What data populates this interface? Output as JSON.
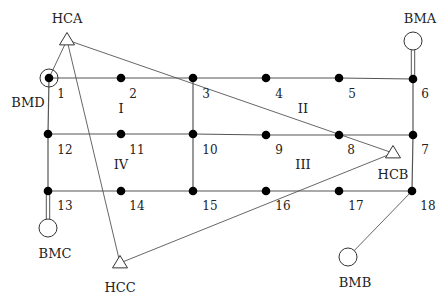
{
  "diagram": {
    "type": "grid-network",
    "colors": {
      "line": "#555555",
      "node": "#000000",
      "background": "#ffffff"
    },
    "nodes": [
      {
        "id": "1",
        "x": 49,
        "y": 78
      },
      {
        "id": "2",
        "x": 121,
        "y": 78
      },
      {
        "id": "3",
        "x": 193,
        "y": 78
      },
      {
        "id": "4",
        "x": 266,
        "y": 78
      },
      {
        "id": "5",
        "x": 339,
        "y": 78
      },
      {
        "id": "6",
        "x": 413,
        "y": 79
      },
      {
        "id": "7",
        "x": 413,
        "y": 135
      },
      {
        "id": "8",
        "x": 339,
        "y": 135
      },
      {
        "id": "9",
        "x": 266,
        "y": 135
      },
      {
        "id": "10",
        "x": 193,
        "y": 134
      },
      {
        "id": "11",
        "x": 121,
        "y": 134
      },
      {
        "id": "12",
        "x": 48,
        "y": 134
      },
      {
        "id": "13",
        "x": 48,
        "y": 191
      },
      {
        "id": "14",
        "x": 121,
        "y": 191
      },
      {
        "id": "15",
        "x": 193,
        "y": 191
      },
      {
        "id": "16",
        "x": 266,
        "y": 191
      },
      {
        "id": "17",
        "x": 339,
        "y": 191
      },
      {
        "id": "18",
        "x": 412,
        "y": 191
      }
    ],
    "node_labels": [
      {
        "text": "1",
        "x": 61,
        "y": 94
      },
      {
        "text": "2",
        "x": 133,
        "y": 94
      },
      {
        "text": "3",
        "x": 206,
        "y": 94
      },
      {
        "text": "4",
        "x": 279,
        "y": 94
      },
      {
        "text": "5",
        "x": 352,
        "y": 94
      },
      {
        "text": "6",
        "x": 425,
        "y": 94
      },
      {
        "text": "7",
        "x": 425,
        "y": 150
      },
      {
        "text": "8",
        "x": 351,
        "y": 150
      },
      {
        "text": "9",
        "x": 279,
        "y": 150
      },
      {
        "text": "10",
        "x": 210,
        "y": 150
      },
      {
        "text": "11",
        "x": 137,
        "y": 150
      },
      {
        "text": "12",
        "x": 65,
        "y": 150
      },
      {
        "text": "13",
        "x": 65,
        "y": 206
      },
      {
        "text": "14",
        "x": 137,
        "y": 206
      },
      {
        "text": "15",
        "x": 210,
        "y": 206
      },
      {
        "text": "16",
        "x": 283,
        "y": 206
      },
      {
        "text": "17",
        "x": 356,
        "y": 206
      },
      {
        "text": "18",
        "x": 428,
        "y": 206
      }
    ],
    "region_labels": [
      {
        "text": "I",
        "x": 121,
        "y": 108
      },
      {
        "text": "II",
        "x": 303,
        "y": 108
      },
      {
        "text": "III",
        "x": 303,
        "y": 164
      },
      {
        "text": "IV",
        "x": 121,
        "y": 164
      }
    ],
    "grid_edges": [
      [
        "1",
        "2"
      ],
      [
        "2",
        "3"
      ],
      [
        "3",
        "4"
      ],
      [
        "4",
        "5"
      ],
      [
        "5",
        "6"
      ],
      [
        "12",
        "11"
      ],
      [
        "11",
        "10"
      ],
      [
        "10",
        "9"
      ],
      [
        "9",
        "8"
      ],
      [
        "8",
        "7"
      ],
      [
        "13",
        "14"
      ],
      [
        "14",
        "15"
      ],
      [
        "15",
        "16"
      ],
      [
        "16",
        "17"
      ],
      [
        "17",
        "18"
      ],
      [
        "1",
        "12"
      ],
      [
        "12",
        "13"
      ],
      [
        "3",
        "10"
      ],
      [
        "10",
        "15"
      ],
      [
        "6",
        "7"
      ],
      [
        "7",
        "18"
      ]
    ],
    "hubs": [
      {
        "id": "HCA",
        "label": "HCA",
        "shape": "triangle",
        "x": 67,
        "y": 40,
        "label_x": 67,
        "label_y": 18
      },
      {
        "id": "HCB",
        "label": "HCB",
        "shape": "triangle",
        "x": 393,
        "y": 153,
        "label_x": 393,
        "label_y": 174
      },
      {
        "id": "HCC",
        "label": "HCC",
        "shape": "triangle",
        "x": 120,
        "y": 263,
        "label_x": 120,
        "label_y": 287
      }
    ],
    "bases": [
      {
        "id": "BMA",
        "label": "BMA",
        "shape": "circle",
        "x": 413,
        "y": 41,
        "r": 9,
        "label_x": 420,
        "label_y": 18,
        "connect": "6",
        "connector": "double"
      },
      {
        "id": "BMB",
        "label": "BMB",
        "shape": "circle",
        "x": 348,
        "y": 257,
        "r": 9,
        "label_x": 355,
        "label_y": 282,
        "connect": "18",
        "connector": "single"
      },
      {
        "id": "BMC",
        "label": "BMC",
        "shape": "circle",
        "x": 48,
        "y": 228,
        "r": 9,
        "label_x": 55,
        "label_y": 253,
        "connect": "13",
        "connector": "double"
      },
      {
        "id": "BMD",
        "label": "BMD",
        "shape": "ring",
        "x": 49,
        "y": 78,
        "r": 9,
        "label_x": 28,
        "label_y": 102,
        "connect": "1",
        "connector": "none"
      }
    ],
    "hub_links": [
      {
        "from": "HCA",
        "to": "1"
      },
      {
        "from": "HCA",
        "to": "HCB"
      },
      {
        "from": "HCA",
        "to": "HCC"
      },
      {
        "from": "HCC",
        "to": "HCB"
      }
    ]
  }
}
